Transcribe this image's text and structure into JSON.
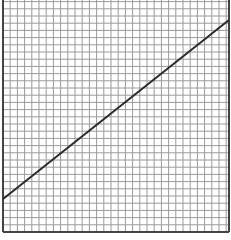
{
  "figure": {
    "grid": {
      "cell_size_px": 7.2,
      "columns": 31,
      "rows": 32,
      "line_color": "#9a9a9a",
      "border_color": "#444444",
      "background": "#ffffff"
    },
    "line": {
      "color": "#2a2a2a",
      "start": {
        "x": 3,
        "y": 199
      },
      "end": {
        "x": 229,
        "y": 20
      }
    }
  }
}
